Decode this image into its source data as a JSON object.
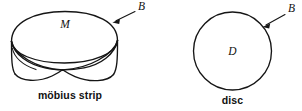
{
  "figure": {
    "background_color": "#ffffff",
    "ink_color": "#151515",
    "panels": [
      {
        "id": "mobius",
        "shape_name": "mobius-strip",
        "surface_label": "M",
        "boundary_label": "B",
        "caption": "möbius strip"
      },
      {
        "id": "disc",
        "shape_name": "disc",
        "surface_label": "D",
        "boundary_label": "B",
        "caption": "disc"
      }
    ]
  }
}
